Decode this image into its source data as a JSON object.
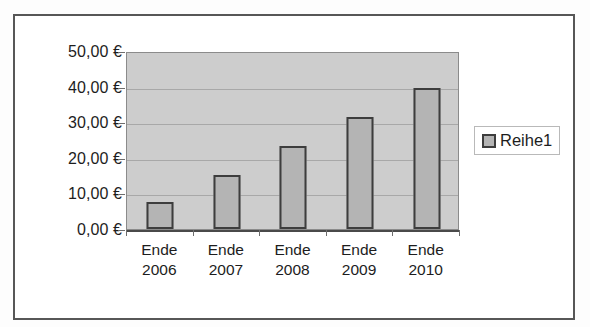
{
  "chart_data": {
    "type": "bar",
    "title": "",
    "subtitle": "",
    "xlabel": "",
    "ylabel": "",
    "categories": [
      "Ende 2006",
      "Ende 2007",
      "Ende 2008",
      "Ende 2009",
      "Ende 2010"
    ],
    "category_lines": [
      [
        "Ende",
        "2006"
      ],
      [
        "Ende",
        "2007"
      ],
      [
        "Ende",
        "2008"
      ],
      [
        "Ende",
        "2009"
      ],
      [
        "Ende",
        "2010"
      ]
    ],
    "series": [
      {
        "name": "Reihe1",
        "values": [
          7.6,
          15.3,
          23.5,
          31.8,
          40.0
        ]
      }
    ],
    "values": [
      7.6,
      15.3,
      23.5,
      31.8,
      40.0
    ],
    "ylim": [
      0,
      50
    ],
    "ytick_values": [
      0,
      10,
      20,
      30,
      40,
      50
    ],
    "ytick_labels": [
      "0,00 €",
      "10,00 €",
      "20,00 €",
      "30,00 €",
      "40,00 €",
      "50,00 €"
    ],
    "y_unit": "€",
    "grid": true,
    "grid_axis": "y",
    "legend": true,
    "legend_position": "right",
    "legend_entries": [
      {
        "label": "Reihe1",
        "swatch_color": "#b4b4b4"
      }
    ],
    "colors": {
      "bar_fill": "#b4b4b4",
      "bar_border": "#3d3d3d",
      "plot_background": "#cdcdcd",
      "gridline": "#a8a8a8",
      "axis": "#4a4a4a",
      "frame_border": "#575757",
      "text": "#1d1d1d",
      "page_background": "#fdfdfd"
    }
  }
}
